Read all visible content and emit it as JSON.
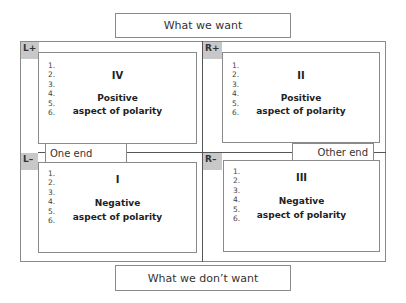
{
  "top_label": "What we want",
  "bottom_label": "What we don’t want",
  "poles": {
    "left_end": "One end",
    "right_end": "Other end"
  },
  "quadrants": [
    {
      "id": "IV",
      "tag": "L+",
      "numeral": "IV",
      "line1": "Positive",
      "line2": "aspect of polarity",
      "items": [
        "1.",
        "2.",
        "3.",
        "4.",
        "5.",
        "6."
      ]
    },
    {
      "id": "II",
      "tag": "R+",
      "numeral": "II",
      "line1": "Positive",
      "line2": "aspect of polarity",
      "items": [
        "1.",
        "2.",
        "3.",
        "4.",
        "5.",
        "6."
      ]
    },
    {
      "id": "I",
      "tag": "L–",
      "numeral": "I",
      "line1": "Negative",
      "line2": "aspect of polarity",
      "items": [
        "1.",
        "2.",
        "3.",
        "4.",
        "5.",
        "6."
      ]
    },
    {
      "id": "III",
      "tag": "R–",
      "numeral": "III",
      "line1": "Negative",
      "line2": "aspect of polarity",
      "items": [
        "1.",
        "2.",
        "3.",
        "4.",
        "5.",
        "6."
      ]
    }
  ],
  "colors": {
    "tag_bg": "#c8c8c8",
    "border": "#8a8a8a",
    "divider": "#555555"
  }
}
